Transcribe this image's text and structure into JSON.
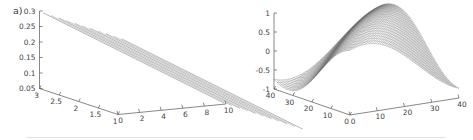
{
  "figure": {
    "background_color": "#ffffff",
    "line_color": "#8a8a8a",
    "axis_color": "#555555",
    "text_color": "#3f3f3f"
  },
  "panels": [
    {
      "id": "a",
      "label": "a)",
      "chart_type": "surface3d"
    },
    {
      "id": "b",
      "label": "b)",
      "chart_type": "surface3d"
    }
  ],
  "chart_data": [
    {
      "type": "line",
      "panel": "a",
      "title": "a)",
      "subtitle": "",
      "surface": "plane",
      "description": "3D mesh surface: a tilted plane drawn as a family of parallel straight mesh lines descending from upper-left to lower-right.",
      "xlabel": "",
      "ylabel": "",
      "zlabel": "",
      "zlim": [
        0.05,
        0.3
      ],
      "z_ticks": [
        "0.3",
        "0.25",
        "0.2",
        "0.15",
        "0.1",
        "0.05"
      ],
      "z_tick_values": [
        0.3,
        0.25,
        0.2,
        0.15,
        0.1,
        0.05
      ],
      "xlim": [
        1,
        3
      ],
      "x_ticks": [
        "3",
        "2.5",
        "2",
        "1.5",
        "1"
      ],
      "x_tick_values": [
        3,
        2.5,
        2,
        1.5,
        1
      ],
      "ylim": [
        0,
        10
      ],
      "y_ticks": [
        "0",
        "2",
        "4",
        "6",
        "8",
        "10"
      ],
      "y_tick_values": [
        0,
        2,
        4,
        6,
        8,
        10
      ],
      "grid": false,
      "legend": "none",
      "mesh_line_count": 11,
      "series": [
        {
          "name": "plane",
          "z_at_corners": {
            "x1_y0": 0.3,
            "x3_y0": 0.3,
            "x1_y10": 0.05,
            "x3_y10": 0.05
          }
        }
      ]
    },
    {
      "type": "line",
      "panel": "b",
      "title": "b)",
      "subtitle": "",
      "surface": "sinusoidal-ripple",
      "description": "3D mesh surface: a smooth sinusoidal wave surface with a crest at the back and a trough at the front, drawn as dense parallel mesh lines.",
      "xlabel": "",
      "ylabel": "",
      "zlabel": "",
      "zlim": [
        -1,
        1
      ],
      "z_ticks": [
        "1",
        "0.5",
        "0",
        "-0.5",
        "-1"
      ],
      "z_tick_values": [
        1,
        0.5,
        0,
        -0.5,
        -1
      ],
      "xlim": [
        0,
        40
      ],
      "x_ticks": [
        "40",
        "30",
        "20",
        "10",
        "0"
      ],
      "x_tick_values": [
        40,
        30,
        20,
        10,
        0
      ],
      "ylim": [
        0,
        40
      ],
      "y_ticks": [
        "0",
        "10",
        "20",
        "30",
        "40"
      ],
      "y_tick_values": [
        0,
        10,
        20,
        30,
        40
      ],
      "grid": false,
      "legend": "none",
      "mesh_line_count": 41,
      "series": [
        {
          "name": "sin-surface",
          "amplitude": 1,
          "periods": 1
        }
      ]
    }
  ]
}
